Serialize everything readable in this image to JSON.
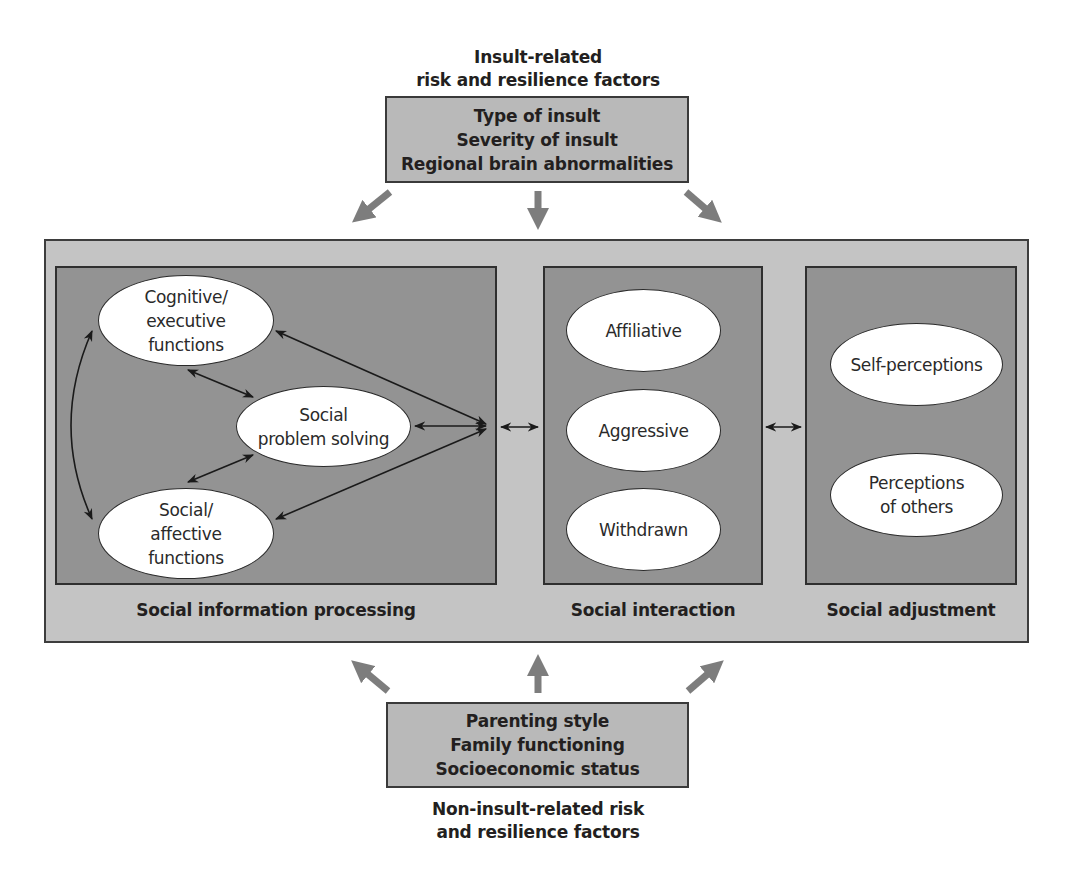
{
  "top_factors": {
    "caption_line1": "Insult-related",
    "caption_line2": "risk and resilience factors",
    "items": [
      "Type of insult",
      "Severity of insult",
      "Regional brain abnormalities"
    ]
  },
  "bottom_factors": {
    "items": [
      "Parenting style",
      "Family functioning",
      "Socioeconomic status"
    ],
    "caption_line1": "Non-insult-related risk",
    "caption_line2": "and resilience factors"
  },
  "panels": {
    "processing": {
      "label": "Social information processing",
      "nodes": {
        "cognitive": [
          "Cognitive/",
          "executive",
          "functions"
        ],
        "problem_solving": [
          "Social",
          "problem solving"
        ],
        "affective": [
          "Social/",
          "affective",
          "functions"
        ]
      }
    },
    "interaction": {
      "label": "Social interaction",
      "nodes": [
        "Affiliative",
        "Aggressive",
        "Withdrawn"
      ]
    },
    "adjustment": {
      "label": "Social adjustment",
      "nodes": {
        "self": [
          "Self-perceptions"
        ],
        "others": [
          "Perceptions",
          "of others"
        ]
      }
    }
  },
  "colors": {
    "outer_box": "#c4c4c4",
    "inner_box": "#939393",
    "factor_box": "#b9b9b9",
    "thick_arrow": "#7d7d7d",
    "thin_arrow": "#1a1a1a"
  }
}
